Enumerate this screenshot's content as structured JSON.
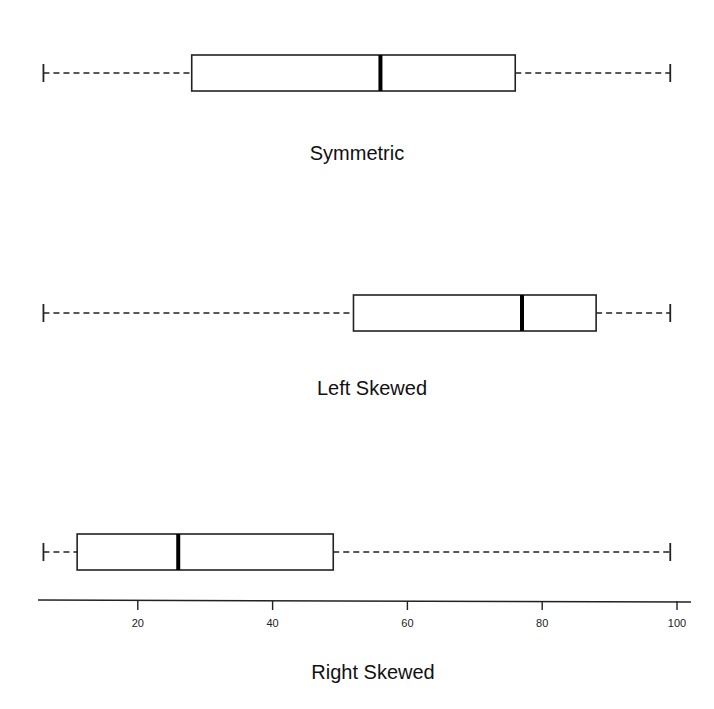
{
  "chart_data": {
    "type": "boxplot",
    "title": "",
    "xlabel": "",
    "xlim": [
      0,
      102
    ],
    "x_ticks": [
      20,
      40,
      60,
      80,
      100
    ],
    "series": [
      {
        "name": "Symmetric",
        "min": 6,
        "q1": 28,
        "median": 56,
        "q3": 76,
        "max": 99
      },
      {
        "name": "Left Skewed",
        "min": 6,
        "q1": 52,
        "median": 77,
        "q3": 88,
        "max": 99
      },
      {
        "name": "Right Skewed",
        "min": 6,
        "q1": 11,
        "median": 26,
        "q3": 49,
        "max": 99
      }
    ]
  },
  "labels": {
    "symmetric": "Symmetric",
    "left": "Left Skewed",
    "right": "Right Skewed"
  },
  "ticks": [
    "20",
    "40",
    "60",
    "80",
    "100"
  ]
}
